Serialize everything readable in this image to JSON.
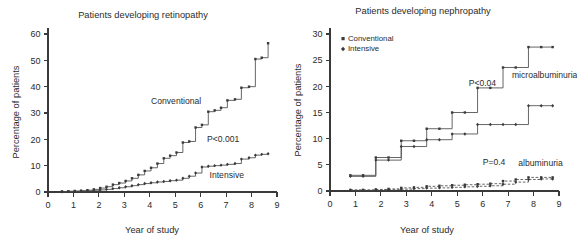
{
  "figure": {
    "background": "#ffffff",
    "line_color": "#4a4a4a",
    "text_color": "#2b2b2b"
  },
  "chart_data": [
    {
      "type": "line",
      "panel": "retinopathy",
      "title": "Patients developing retinopathy",
      "xlabel": "Year of study",
      "ylabel": "Percentage of patients",
      "xlim": [
        0,
        9
      ],
      "ylim": [
        0,
        60
      ],
      "xticks": [
        0,
        1,
        2,
        3,
        4,
        5,
        6,
        7,
        8,
        9
      ],
      "yticks": [
        0,
        10,
        20,
        30,
        40,
        50,
        60
      ],
      "grid": false,
      "step": "post",
      "legend_position": "inline-annotation",
      "annotations": [
        {
          "text": "Conventional",
          "x": 4.05,
          "y": 33.5
        },
        {
          "text": "P<0.001",
          "x": 6.25,
          "y": 19.0
        },
        {
          "text": "Intensive",
          "x": 6.35,
          "y": 5.5
        }
      ],
      "series": [
        {
          "name": "Conventional",
          "marker": "square",
          "linestyle": "solid",
          "x": [
            0.55,
            0.8,
            1.05,
            1.3,
            1.55,
            1.8,
            2.05,
            2.3,
            2.55,
            2.8,
            3.05,
            3.3,
            3.55,
            3.8,
            4.05,
            4.3,
            4.55,
            4.8,
            5.05,
            5.3,
            5.55,
            5.8,
            6.05,
            6.3,
            6.55,
            6.8,
            7.05,
            7.35,
            7.6,
            7.9,
            8.15,
            8.4,
            8.65
          ],
          "y": [
            0.2,
            0.3,
            0.4,
            0.5,
            0.7,
            1.0,
            1.5,
            2.0,
            2.8,
            3.4,
            4.2,
            5.2,
            6.5,
            8.0,
            9.2,
            10.8,
            12.8,
            13.8,
            15.0,
            18.8,
            19.2,
            24.5,
            25.5,
            30.5,
            31.0,
            32.0,
            34.8,
            35.2,
            39.6,
            40.0,
            50.5,
            51.0,
            56.5
          ]
        },
        {
          "name": "Intensive",
          "marker": "diamond",
          "linestyle": "solid",
          "x": [
            0.55,
            0.8,
            1.05,
            1.3,
            1.55,
            1.8,
            2.05,
            2.3,
            2.55,
            2.8,
            3.05,
            3.3,
            3.55,
            3.8,
            4.05,
            4.3,
            4.55,
            4.8,
            5.05,
            5.3,
            5.55,
            5.8,
            6.05,
            6.3,
            6.55,
            6.8,
            7.05,
            7.35,
            7.6,
            7.9,
            8.15,
            8.4,
            8.65
          ],
          "y": [
            0.1,
            0.15,
            0.2,
            0.3,
            0.4,
            0.5,
            0.8,
            1.0,
            1.3,
            1.6,
            2.0,
            2.4,
            2.8,
            3.2,
            3.5,
            3.8,
            4.0,
            4.3,
            4.5,
            5.2,
            6.0,
            7.2,
            9.5,
            9.8,
            10.0,
            10.2,
            10.5,
            10.8,
            12.5,
            13.0,
            14.0,
            14.3,
            14.5
          ]
        }
      ]
    },
    {
      "type": "line",
      "panel": "nephropathy",
      "title": "Patients developing nephropathy",
      "xlabel": "Year of study",
      "ylabel": "Percentage of patients",
      "xlim": [
        0,
        9
      ],
      "ylim": [
        0,
        30
      ],
      "xticks": [
        0,
        1,
        2,
        3,
        4,
        5,
        6,
        7,
        8,
        9
      ],
      "yticks": [
        0,
        5,
        10,
        15,
        20,
        25,
        30
      ],
      "grid": false,
      "step": "post",
      "legend_position": "top-left",
      "legend": [
        {
          "label": "Conventional",
          "marker": "square"
        },
        {
          "label": "Intensive",
          "marker": "diamond"
        }
      ],
      "annotations": [
        {
          "text": "P<0.04",
          "x": 5.45,
          "y": 20.0
        },
        {
          "text": "microalbuminuria",
          "x": 7.15,
          "y": 21.5
        },
        {
          "text": "P=0.4",
          "x": 6.0,
          "y": 5.0
        },
        {
          "text": "albuminuria",
          "x": 7.4,
          "y": 4.8
        }
      ],
      "series": [
        {
          "name": "Conventional microalbuminuria",
          "marker": "square",
          "linestyle": "solid",
          "group": "microalbuminuria",
          "x": [
            0.8,
            1.3,
            1.8,
            2.3,
            2.8,
            3.3,
            3.8,
            4.3,
            4.8,
            5.3,
            5.8,
            6.3,
            6.8,
            7.3,
            7.8,
            8.3,
            8.75
          ],
          "y": [
            3.0,
            3.0,
            6.4,
            6.4,
            9.6,
            9.6,
            11.9,
            11.9,
            15.0,
            15.0,
            19.7,
            19.7,
            23.6,
            23.6,
            27.5,
            27.5,
            27.5
          ]
        },
        {
          "name": "Intensive microalbuminuria",
          "marker": "diamond",
          "linestyle": "solid",
          "group": "microalbuminuria",
          "x": [
            0.8,
            1.3,
            1.8,
            2.3,
            2.8,
            3.3,
            3.8,
            4.3,
            4.8,
            5.3,
            5.8,
            6.3,
            6.8,
            7.3,
            7.8,
            8.3,
            8.75
          ],
          "y": [
            2.8,
            2.8,
            5.9,
            5.9,
            8.5,
            8.5,
            9.8,
            9.8,
            10.9,
            10.9,
            12.7,
            12.7,
            12.7,
            12.7,
            16.3,
            16.3,
            16.3
          ]
        },
        {
          "name": "Conventional albuminuria",
          "marker": "square",
          "linestyle": "dashed",
          "group": "albuminuria",
          "x": [
            0.8,
            1.3,
            1.8,
            2.3,
            2.8,
            3.3,
            3.8,
            4.3,
            4.8,
            5.3,
            5.8,
            6.3,
            6.8,
            7.3,
            7.8,
            8.3,
            8.75
          ],
          "y": [
            0.2,
            0.2,
            0.3,
            0.4,
            0.6,
            0.7,
            0.9,
            1.0,
            1.1,
            1.2,
            1.3,
            1.4,
            1.9,
            2.2,
            2.6,
            2.6,
            2.6
          ]
        },
        {
          "name": "Intensive albuminuria",
          "marker": "diamond",
          "linestyle": "dashed",
          "group": "albuminuria",
          "x": [
            0.8,
            1.3,
            1.8,
            2.3,
            2.8,
            3.3,
            3.8,
            4.3,
            4.8,
            5.3,
            5.8,
            6.3,
            6.8,
            7.3,
            7.8,
            8.3,
            8.75
          ],
          "y": [
            0.15,
            0.15,
            0.2,
            0.25,
            0.35,
            0.45,
            0.55,
            0.6,
            0.7,
            0.8,
            0.9,
            1.0,
            1.3,
            1.7,
            2.2,
            2.3,
            2.3
          ]
        }
      ]
    }
  ]
}
